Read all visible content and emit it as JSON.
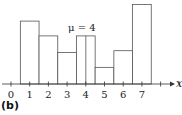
{
  "chart_data": {
    "type": "bar",
    "title": "",
    "annotation": "μ = 4",
    "xlabel": "x",
    "ylabel": "",
    "x_ticks": [
      0,
      1,
      2,
      3,
      4,
      5,
      6,
      7
    ],
    "extra_minor_ticks": [
      8,
      9
    ],
    "categories": [
      1,
      2,
      3,
      4,
      5,
      6,
      7
    ],
    "values": [
      3.4,
      2.6,
      1.7,
      2.6,
      0.9,
      1.8,
      4.3
    ],
    "bar_width": 1,
    "mean_line_at": 4,
    "xlim": [
      0,
      9.5
    ],
    "ylim": [
      0,
      4.5
    ],
    "grid": false,
    "legend": "none",
    "y_axis_visible": false
  },
  "labels": {
    "panel": "(b)",
    "mean": "μ = 4",
    "x_axis": "x"
  },
  "style": {
    "bar_stroke": "#555555",
    "bar_fill": "#ffffff",
    "axis_color": "#333333",
    "text_color": "#222222"
  }
}
